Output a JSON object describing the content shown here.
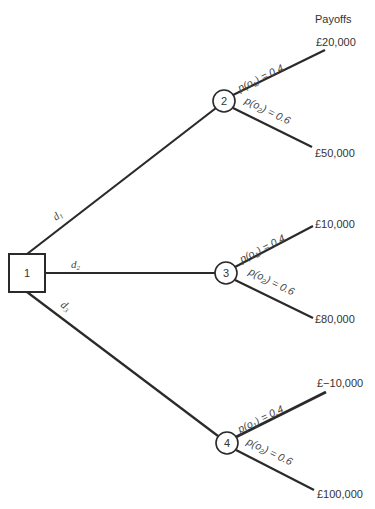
{
  "header": {
    "payoffs_title": "Payoffs"
  },
  "decision_node": {
    "id": "1",
    "label": "1"
  },
  "decisions": [
    {
      "label": "d",
      "sub": "1",
      "target": "2"
    },
    {
      "label": "d",
      "sub": "2",
      "target": "3"
    },
    {
      "label": "d",
      "sub": "3",
      "target": "4"
    }
  ],
  "chance_nodes": [
    {
      "id": "2",
      "label": "2",
      "outcomes": [
        {
          "prob_prefix": "p(o",
          "prob_sub": "1",
          "prob_suffix": ") = 0.4",
          "payoff": "£20,000"
        },
        {
          "prob_prefix": "p(o",
          "prob_sub": "2",
          "prob_suffix": ") = 0.6",
          "payoff": "£50,000"
        }
      ]
    },
    {
      "id": "3",
      "label": "3",
      "outcomes": [
        {
          "prob_prefix": "p(o",
          "prob_sub": "1",
          "prob_suffix": ") = 0.4",
          "payoff": "£10,000"
        },
        {
          "prob_prefix": "p(o",
          "prob_sub": "2",
          "prob_suffix": ") = 0.6",
          "payoff": "£80,000"
        }
      ]
    },
    {
      "id": "4",
      "label": "4",
      "outcomes": [
        {
          "prob_prefix": "p(o",
          "prob_sub": "1",
          "prob_suffix": ") = 0.4",
          "payoff": "£−10,000"
        },
        {
          "prob_prefix": "p(o",
          "prob_sub": "2",
          "prob_suffix": ") = 0.6",
          "payoff": "£100,000"
        }
      ]
    }
  ],
  "colors": {
    "line": "#2a2a2a",
    "text": "#333333",
    "background": "#ffffff"
  }
}
